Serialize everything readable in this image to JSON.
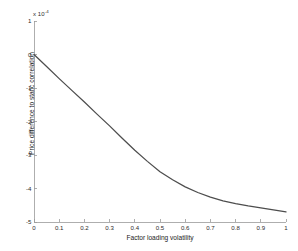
{
  "chart_data": {
    "type": "line",
    "title": "",
    "xlabel": "Factor loading volatility",
    "ylabel": "Price difference to static correlation",
    "y_exponent_label": "x 10",
    "y_exponent_power": "-4",
    "xlim": [
      0,
      1
    ],
    "ylim": [
      -5,
      1
    ],
    "grid": false,
    "legend": null,
    "x_ticks": [
      "0",
      "0.1",
      "0.2",
      "0.3",
      "0.4",
      "0.5",
      "0.6",
      "0.7",
      "0.8",
      "0.9",
      "1"
    ],
    "x_tick_values": [
      0,
      0.1,
      0.2,
      0.3,
      0.4,
      0.5,
      0.6,
      0.7,
      0.8,
      0.9,
      1
    ],
    "y_ticks": [
      "1",
      "0",
      "-1",
      "-2",
      "-3",
      "-4",
      "-5"
    ],
    "y_tick_values": [
      1,
      0,
      -1,
      -2,
      -3,
      -4,
      -5
    ],
    "line_color": "#4d4d4d",
    "axis_color": "#9a9a9a",
    "background": "#ffffff",
    "series": [
      {
        "name": "price difference",
        "x": [
          0,
          0.05,
          0.1,
          0.15,
          0.2,
          0.25,
          0.3,
          0.35,
          0.4,
          0.45,
          0.5,
          0.55,
          0.6,
          0.65,
          0.7,
          0.75,
          0.8,
          0.85,
          0.9,
          0.95,
          1
        ],
        "values": [
          0,
          -0.36,
          -0.72,
          -1.07,
          -1.42,
          -1.78,
          -2.13,
          -2.5,
          -2.86,
          -3.19,
          -3.5,
          -3.74,
          -3.95,
          -4.12,
          -4.26,
          -4.37,
          -4.45,
          -4.52,
          -4.58,
          -4.64,
          -4.7
        ]
      }
    ]
  },
  "axes": {
    "plot_left_px": 34,
    "plot_right_px": 286,
    "plot_top_px": 21,
    "plot_bottom_px": 222
  }
}
